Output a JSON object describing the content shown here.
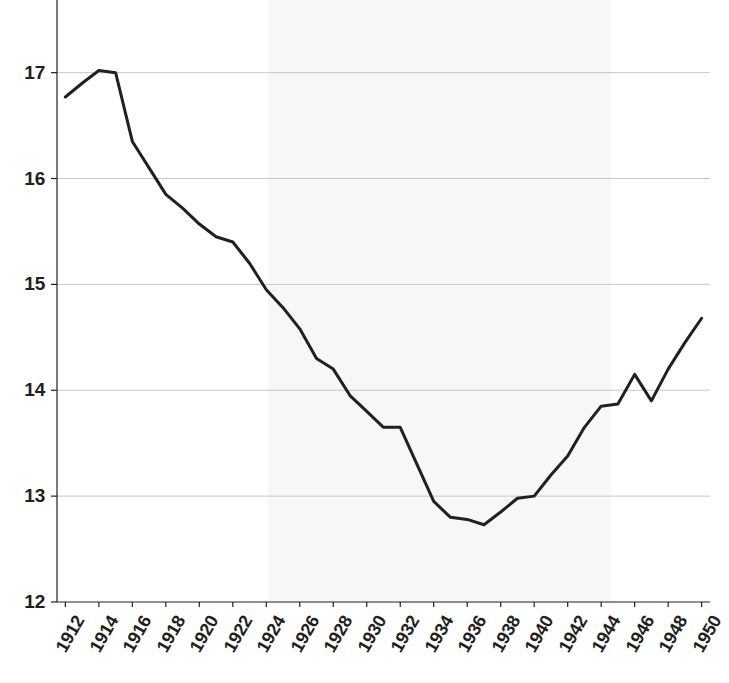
{
  "chart_data": {
    "type": "line",
    "title": "",
    "subtitle": "",
    "xlabel": "",
    "ylabel": "",
    "x": [
      1912,
      1913,
      1914,
      1915,
      1916,
      1917,
      1918,
      1919,
      1920,
      1921,
      1922,
      1923,
      1924,
      1925,
      1926,
      1927,
      1928,
      1929,
      1930,
      1931,
      1932,
      1933,
      1934,
      1935,
      1936,
      1937,
      1938,
      1939,
      1940,
      1941,
      1942,
      1943,
      1944,
      1945,
      1946,
      1947,
      1948,
      1949,
      1950
    ],
    "values": [
      16.77,
      16.9,
      17.02,
      17.0,
      16.35,
      16.1,
      15.85,
      15.72,
      15.57,
      15.45,
      15.4,
      15.2,
      14.95,
      14.78,
      14.58,
      14.3,
      14.2,
      13.95,
      13.8,
      13.65,
      13.65,
      13.3,
      12.95,
      12.8,
      12.78,
      12.73,
      12.85,
      12.98,
      13.0,
      13.2,
      13.38,
      13.65,
      13.85,
      13.87,
      14.15,
      13.9,
      14.2,
      14.45,
      14.68
    ],
    "series": [
      {
        "name": "series-1",
        "values": [
          16.77,
          16.9,
          17.02,
          17.0,
          16.35,
          16.1,
          15.85,
          15.72,
          15.57,
          15.45,
          15.4,
          15.2,
          14.95,
          14.78,
          14.58,
          14.3,
          14.2,
          13.95,
          13.8,
          13.65,
          13.65,
          13.3,
          12.95,
          12.8,
          12.78,
          12.73,
          12.85,
          12.98,
          13.0,
          13.2,
          13.38,
          13.65,
          13.85,
          13.87,
          14.15,
          13.9,
          14.2,
          14.45,
          14.68
        ],
        "color": "#231f20"
      }
    ],
    "xlim": [
      1911.5,
      1950.5
    ],
    "ylim": [
      12,
      17.45
    ],
    "xticks": [
      1912,
      1914,
      1916,
      1918,
      1920,
      1922,
      1924,
      1926,
      1928,
      1930,
      1932,
      1934,
      1936,
      1938,
      1940,
      1942,
      1944,
      1946,
      1948,
      1950
    ],
    "xtick_labels": [
      "1912",
      "1914",
      "1916",
      "1918",
      "1920",
      "1922",
      "1924",
      "1926",
      "1928",
      "1930",
      "1932",
      "1934",
      "1936",
      "1938",
      "1940",
      "1942",
      "1944",
      "1946",
      "1948",
      "1950"
    ],
    "yticks": [
      12,
      13,
      14,
      15,
      16,
      17
    ],
    "ytick_labels": [
      "12",
      "13",
      "14",
      "15",
      "16",
      "17"
    ],
    "grid": "horizontal",
    "legend": "none",
    "shaded_regions": [
      {
        "name": "highlight-band",
        "x_start": 1924.1,
        "x_end": 1944.6,
        "color": "#f7f7f7"
      }
    ],
    "axis_color": "#231f20",
    "grid_color": "#c8c8c8",
    "line_color": "#231f20",
    "line_width": 3,
    "background": "#ffffff"
  },
  "axes": {
    "y_axis_name": "y-axis",
    "x_axis_name": "x-axis"
  }
}
